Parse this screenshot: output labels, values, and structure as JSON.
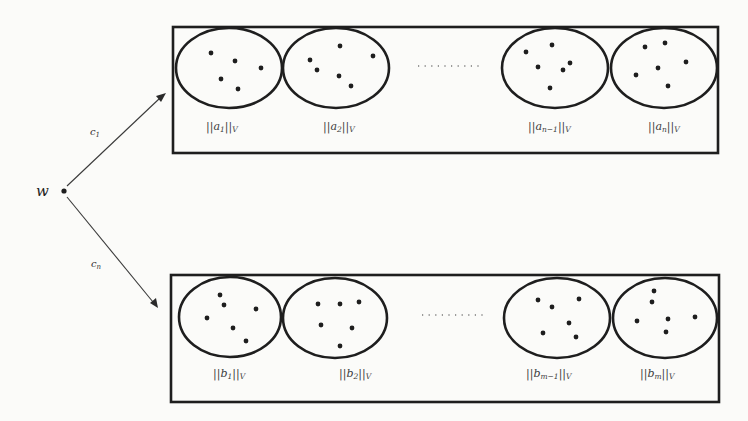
{
  "diagram": {
    "source_node": {
      "label": "w"
    },
    "edges": [
      {
        "label": "c",
        "subscript": "1",
        "to": "top_box"
      },
      {
        "label": "c",
        "subscript": "n",
        "to": "bottom_box"
      }
    ],
    "top_box": {
      "ellipsis": "..........",
      "sets": [
        {
          "label_prefix": "||a",
          "label_sub": "1",
          "label_suffix": "||",
          "norm_sub": "V",
          "points": 5
        },
        {
          "label_prefix": "||a",
          "label_sub": "2",
          "label_suffix": "||",
          "norm_sub": "V",
          "points": 6
        },
        {
          "label_prefix": "||a",
          "label_sub": "n−1",
          "label_suffix": "||",
          "norm_sub": "V",
          "points": 6
        },
        {
          "label_prefix": "||a",
          "label_sub": "n",
          "label_suffix": "||",
          "norm_sub": "V",
          "points": 6
        }
      ]
    },
    "bottom_box": {
      "ellipsis": "..........",
      "sets": [
        {
          "label_prefix": "||b",
          "label_sub": "1",
          "label_suffix": "||",
          "norm_sub": "V",
          "points": 6
        },
        {
          "label_prefix": "||b",
          "label_sub": "2",
          "label_suffix": "||",
          "norm_sub": "V",
          "points": 6
        },
        {
          "label_prefix": "||b",
          "label_sub": "m−1",
          "label_suffix": "||",
          "norm_sub": "V",
          "points": 6
        },
        {
          "label_prefix": "||b",
          "label_sub": "m",
          "label_suffix": "||",
          "norm_sub": "V",
          "points": 6
        }
      ]
    },
    "colors": {
      "stroke": "#1e1e1e",
      "background": "#fbfbf9",
      "label": "#3c3c3c"
    }
  }
}
